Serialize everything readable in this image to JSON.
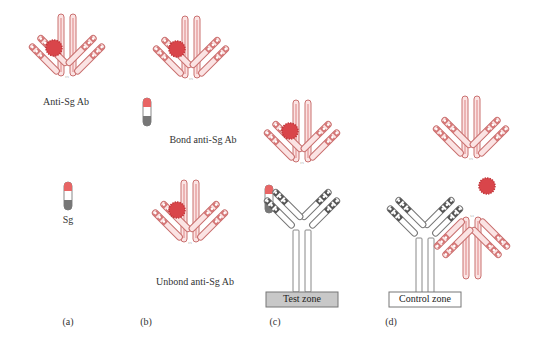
{
  "figure": {
    "panels": [
      {
        "id": "a",
        "label": "(a)",
        "items": [
          {
            "name": "anti-sg-antibody",
            "caption": "Anti-Sg Ab"
          },
          {
            "name": "sg-antigen",
            "caption": "Sg"
          }
        ]
      },
      {
        "id": "b",
        "label": "(b)",
        "items": [
          {
            "name": "bond-antibody",
            "caption": "Bond anti-Sg Ab"
          },
          {
            "name": "unbond-antibody",
            "caption": "Unbond anti-Sg Ab"
          }
        ]
      },
      {
        "id": "c",
        "label": "(c)",
        "zone": "Test zone"
      },
      {
        "id": "d",
        "label": "(d)",
        "zone": "Control zone"
      }
    ],
    "colors": {
      "antibody_red": "#e8a0a0",
      "antibody_red_stroke": "#c9706f",
      "antigen_ball": "#d9454a",
      "capture_gray_stroke": "#8a8a8a",
      "test_zone_fill": "#c8c8c8",
      "control_zone_fill": "#ffffff"
    }
  }
}
